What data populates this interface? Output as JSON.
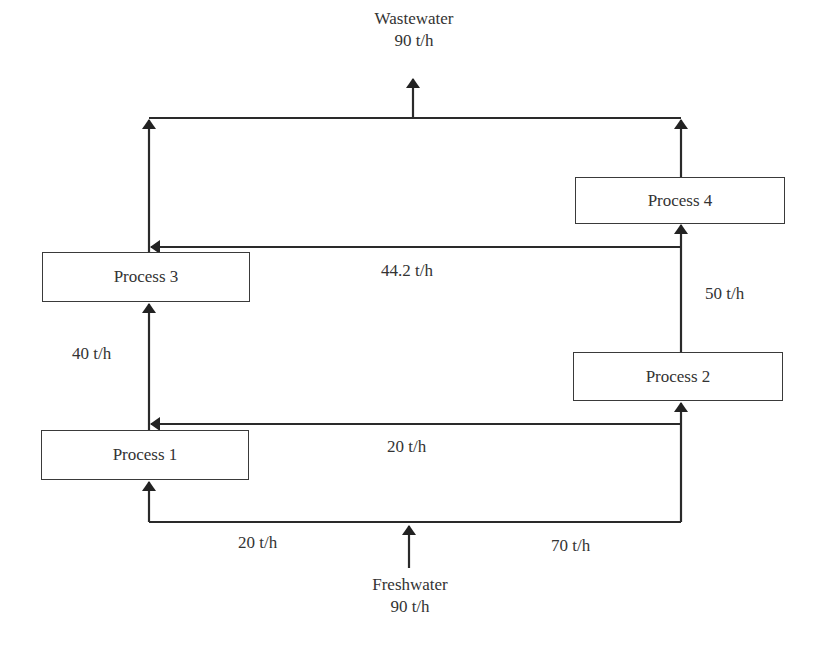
{
  "diagram": {
    "type": "water-network-flowsheet",
    "processes": [
      {
        "id": "p1",
        "label": "Process 1"
      },
      {
        "id": "p2",
        "label": "Process 2"
      },
      {
        "id": "p3",
        "label": "Process 3"
      },
      {
        "id": "p4",
        "label": "Process 4"
      }
    ],
    "source": {
      "label": "Freshwater",
      "flow": "90 t/h"
    },
    "sink": {
      "label": "Wastewater",
      "flow": "90 t/h"
    },
    "streams": [
      {
        "from": "Freshwater",
        "to": "Process 1",
        "flow": "20 t/h"
      },
      {
        "from": "Freshwater",
        "to": "Process 2",
        "flow": "70 t/h"
      },
      {
        "from": "Process 2",
        "to": "Process 1",
        "flow": "20 t/h"
      },
      {
        "from": "Process 1",
        "to": "Process 3",
        "flow": "40 t/h"
      },
      {
        "from": "Process 2",
        "to": "Process 4",
        "flow": "50 t/h"
      },
      {
        "from": "Process 4",
        "to": "Process 3",
        "flow": "44.2 t/h"
      },
      {
        "from": "Process 3",
        "to": "Wastewater",
        "flow": ""
      },
      {
        "from": "Process 4",
        "to": "Wastewater",
        "flow": ""
      }
    ],
    "labels": {
      "fresh_to_p1": "20 t/h",
      "fresh_to_p2": "70 t/h",
      "p2_to_p1": "20 t/h",
      "p1_to_p3": "40 t/h",
      "p2_to_p4": "50 t/h",
      "p4_to_p3": "44.2 t/h"
    }
  }
}
